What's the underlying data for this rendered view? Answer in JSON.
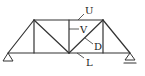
{
  "diagram": {
    "type": "truss",
    "labels": {
      "top_chord": "U",
      "vertical": "V",
      "diagonal": "D",
      "bottom_chord": "L"
    },
    "supports": {
      "left": "pin",
      "right": "roller"
    },
    "colors": {
      "line": "#333333",
      "background": "#ffffff"
    }
  }
}
